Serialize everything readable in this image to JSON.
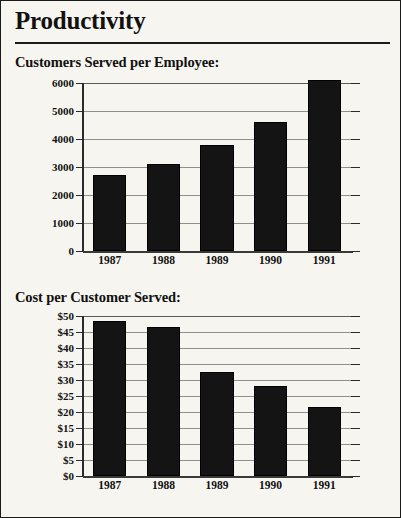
{
  "document": {
    "title": "Productivity",
    "background_color": "#f7f5f0",
    "border_color": "#1a1a1a",
    "ink_color": "#141414"
  },
  "sections": [
    {
      "caption": "Customers Served per Employee:"
    },
    {
      "caption": "Cost per Customer Served:"
    }
  ],
  "chart_data": [
    {
      "type": "bar",
      "title": "Customers Served per Employee:",
      "xlabel": "",
      "ylabel": "",
      "categories": [
        "1987",
        "1988",
        "1989",
        "1990",
        "1991"
      ],
      "values": [
        2700,
        3100,
        3800,
        4600,
        6100
      ],
      "ylim": [
        0,
        6000
      ],
      "yticks": [
        0,
        1000,
        2000,
        3000,
        4000,
        5000,
        6000
      ],
      "ytick_labels": [
        "0",
        "1000",
        "2000",
        "3000",
        "4000",
        "5000",
        "6000"
      ],
      "grid": true,
      "legend": "none",
      "bar_color": "#141414"
    },
    {
      "type": "bar",
      "title": "Cost per Customer Served:",
      "xlabel": "",
      "ylabel": "",
      "categories": [
        "1987",
        "1988",
        "1989",
        "1990",
        "1991"
      ],
      "values": [
        48.5,
        46.5,
        32.5,
        28.0,
        21.5
      ],
      "ylim": [
        0,
        50
      ],
      "yticks": [
        0,
        5,
        10,
        15,
        20,
        25,
        30,
        35,
        40,
        45,
        50
      ],
      "ytick_labels": [
        "$0",
        "$5",
        "$10",
        "$15",
        "$20",
        "$25",
        "$30",
        "$35",
        "$40",
        "$45",
        "$50"
      ],
      "grid": true,
      "legend": "none",
      "bar_color": "#141414"
    }
  ]
}
